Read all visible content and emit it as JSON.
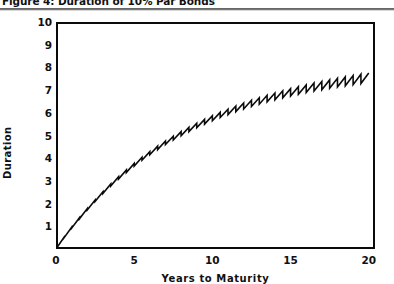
{
  "figure": {
    "caption": "Figure 4: Duration of 10% Par Bonds",
    "rule": "horizontal-rule"
  },
  "chart_data": {
    "type": "line",
    "title": "Figure 4: Duration of 10% Par Bonds",
    "xlabel": "Years to Maturity",
    "ylabel": "Duration",
    "xlim": [
      0,
      20.4
    ],
    "ylim": [
      0,
      10
    ],
    "xticks": [
      0,
      5,
      10,
      15,
      20
    ],
    "xtick_labels": [
      "0",
      "5",
      "10",
      "15",
      "20"
    ],
    "yticks": [
      1,
      2,
      3,
      4,
      5,
      6,
      7,
      8,
      9,
      10
    ],
    "ytick_labels": [
      "1",
      "2",
      "3",
      "4",
      "5",
      "6",
      "7",
      "8",
      "9",
      "10"
    ],
    "grid": false,
    "legend": false,
    "frame": "box",
    "series": [
      {
        "name": "Duration of 10% par bond",
        "description": "Sawtooth curve: duration rises within each coupon period then drops at each coupon payment; overall concave increase from 0 to about 9.7 years.",
        "line_color": "#0a0a0a",
        "line_width": 1.6,
        "points": [
          [
            0.0,
            0.0
          ],
          [
            0.5,
            0.5
          ],
          [
            0.5,
            0.48
          ],
          [
            1.0,
            0.96
          ],
          [
            1.0,
            0.92
          ],
          [
            1.5,
            1.38
          ],
          [
            1.5,
            1.33
          ],
          [
            2.0,
            1.78
          ],
          [
            2.0,
            1.72
          ],
          [
            2.5,
            2.16
          ],
          [
            2.5,
            2.09
          ],
          [
            3.0,
            2.52
          ],
          [
            3.0,
            2.44
          ],
          [
            3.5,
            2.86
          ],
          [
            3.5,
            2.77
          ],
          [
            4.0,
            3.18
          ],
          [
            4.0,
            3.08
          ],
          [
            4.5,
            3.48
          ],
          [
            4.5,
            3.37
          ],
          [
            5.0,
            3.77
          ],
          [
            5.0,
            3.65
          ],
          [
            5.5,
            4.04
          ],
          [
            5.5,
            3.91
          ],
          [
            6.0,
            4.29
          ],
          [
            6.0,
            4.15
          ],
          [
            6.5,
            4.53
          ],
          [
            6.5,
            4.38
          ],
          [
            7.0,
            4.76
          ],
          [
            7.0,
            4.6
          ],
          [
            7.5,
            4.97
          ],
          [
            7.5,
            4.8
          ],
          [
            8.0,
            5.17
          ],
          [
            8.0,
            4.99
          ],
          [
            8.5,
            5.36
          ],
          [
            8.5,
            5.17
          ],
          [
            9.0,
            5.54
          ],
          [
            9.0,
            5.34
          ],
          [
            9.5,
            5.71
          ],
          [
            9.5,
            5.5
          ],
          [
            10.0,
            5.87
          ],
          [
            10.0,
            5.65
          ],
          [
            10.5,
            6.02
          ],
          [
            10.5,
            5.79
          ],
          [
            11.0,
            6.16
          ],
          [
            11.0,
            5.92
          ],
          [
            11.5,
            6.3
          ],
          [
            11.5,
            6.05
          ],
          [
            12.0,
            6.43
          ],
          [
            12.0,
            6.17
          ],
          [
            12.5,
            6.55
          ],
          [
            12.5,
            6.28
          ],
          [
            13.0,
            6.66
          ],
          [
            13.0,
            6.38
          ],
          [
            13.5,
            6.77
          ],
          [
            13.5,
            6.48
          ],
          [
            14.0,
            6.87
          ],
          [
            14.0,
            6.57
          ],
          [
            14.5,
            6.97
          ],
          [
            14.5,
            6.66
          ],
          [
            15.0,
            7.06
          ],
          [
            15.0,
            6.74
          ],
          [
            15.5,
            7.15
          ],
          [
            15.5,
            6.82
          ],
          [
            16.0,
            7.23
          ],
          [
            16.0,
            6.89
          ],
          [
            16.5,
            7.31
          ],
          [
            16.5,
            6.96
          ],
          [
            17.0,
            7.38
          ],
          [
            17.0,
            7.02
          ],
          [
            17.5,
            7.45
          ],
          [
            17.5,
            7.08
          ],
          [
            18.0,
            7.52
          ],
          [
            18.0,
            7.14
          ],
          [
            18.5,
            7.58
          ],
          [
            18.5,
            7.19
          ],
          [
            19.0,
            7.64
          ],
          [
            19.0,
            7.24
          ],
          [
            19.5,
            7.7
          ],
          [
            19.5,
            7.29
          ],
          [
            20.0,
            7.75
          ]
        ]
      }
    ]
  }
}
